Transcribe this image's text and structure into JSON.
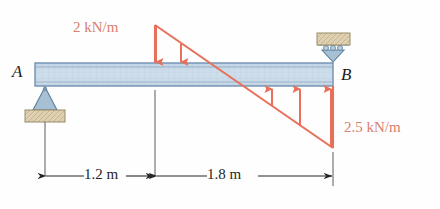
{
  "figure": {
    "type": "beam-load-diagram",
    "title": "",
    "colors": {
      "beam_fill": "#c9d9e8",
      "beam_stroke": "#6f8fb0",
      "load_red": "#e8705a",
      "load_text": "#d8806f",
      "support_block": "#ded0b0",
      "support_block_stroke": "#9a8a66",
      "support_body": "#a8c0d4",
      "dimension": "#262626",
      "node_text": "#1c1c1c"
    },
    "beam": {
      "left_node_label": "A",
      "right_node_label": "B",
      "length_m": 3.0
    },
    "supports": [
      {
        "at": "A",
        "kind": "pin-support",
        "position": "below-beam"
      },
      {
        "at": "B",
        "kind": "roller-support",
        "position": "above-beam"
      }
    ],
    "loads": [
      {
        "label": "2 kN/m",
        "magnitude": 2,
        "unit": "kN/m",
        "direction": "downward",
        "arrow_count": 2,
        "span_m": 1.2,
        "note": "distributed load decreasing from 2 kN/m at 1.2 m to zero"
      },
      {
        "label": "2.5 kN/m",
        "magnitude": 2.5,
        "unit": "kN/m",
        "direction": "upward",
        "arrow_count": 3,
        "span_m": 1.8,
        "note": "distributed load increasing to 2.5 kN/m at B"
      }
    ],
    "dimensions": [
      {
        "label": "1.2 m",
        "value": 1.2,
        "unit": "m",
        "from": "A",
        "to": "peak"
      },
      {
        "label": "1.8 m",
        "value": 1.8,
        "unit": "m",
        "from": "peak",
        "to": "B"
      }
    ]
  }
}
